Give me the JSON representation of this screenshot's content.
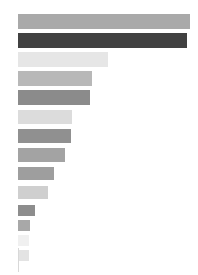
{
  "chart_data": {
    "type": "bar",
    "orientation": "horizontal",
    "title": "",
    "subtitle": "",
    "xlabel": "",
    "ylabel": "",
    "legend": [],
    "grid": false,
    "xlim": [
      0,
      172
    ],
    "categories": [
      "bar-1",
      "bar-2",
      "bar-3",
      "bar-4",
      "bar-5",
      "bar-6",
      "bar-7",
      "bar-8",
      "bar-9",
      "bar-10",
      "bar-11",
      "bar-12",
      "bar-13",
      "bar-14"
    ],
    "values": [
      172,
      169,
      90,
      74,
      72,
      54,
      53,
      47,
      36,
      30,
      17,
      12,
      11,
      11
    ],
    "colors": [
      "#a9a9a9",
      "#414141",
      "#e6e6e6",
      "#b8b8b8",
      "#8b8b8b",
      "#dcdcdc",
      "#909090",
      "#a3a3a3",
      "#9e9e9e",
      "#cfcfcf",
      "#8d8d8d",
      "#a8a8a8",
      "#f0f0f0",
      "#e3e3e3"
    ],
    "bar_tops": [
      14,
      33,
      52,
      71,
      90,
      110,
      129,
      148,
      167,
      186,
      205,
      220,
      235,
      250
    ],
    "bar_height": [
      15,
      15,
      15,
      15,
      15,
      14,
      14,
      14,
      13,
      13,
      11,
      11,
      11,
      11
    ],
    "axis": {
      "visible": true,
      "x": 18,
      "y_start": 248,
      "y_end": 272,
      "color": "#d8d8d8"
    },
    "tick_labels": [],
    "annotations": []
  }
}
